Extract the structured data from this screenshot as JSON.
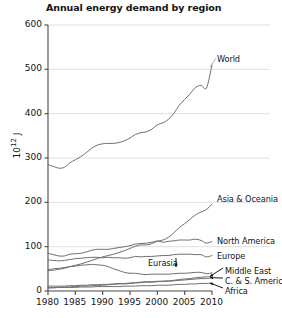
{
  "chart_data": {
    "type": "line",
    "title": "Annual energy demand by region",
    "xlabel": "",
    "ylabel": "10^12 J",
    "ylabel_base": "10",
    "ylabel_exp": "12",
    "ylabel_unit": "J",
    "xlim": [
      1980,
      2010
    ],
    "ylim": [
      0,
      600
    ],
    "yticks": [
      0,
      100,
      200,
      300,
      400,
      500,
      600
    ],
    "xticks": [
      1980,
      1985,
      1990,
      1995,
      2000,
      2005,
      2010
    ],
    "grid": "horizontal",
    "legend_position": "inline-right",
    "line_color": "#6e6e6e",
    "grid_color": "#d8d8d8",
    "axis_color": "#4a4a4a",
    "x": [
      1980,
      1981,
      1982,
      1983,
      1984,
      1985,
      1986,
      1987,
      1988,
      1989,
      1990,
      1991,
      1992,
      1993,
      1994,
      1995,
      1996,
      1997,
      1998,
      1999,
      2000,
      2001,
      2002,
      2003,
      2004,
      2005,
      2006,
      2007,
      2008,
      2009,
      2010
    ],
    "series": [
      {
        "name": "World",
        "label": "World",
        "values": [
          285,
          281,
          277,
          279,
          289,
          296,
          303,
          312,
          322,
          329,
          332,
          333,
          333,
          335,
          339,
          345,
          353,
          357,
          359,
          365,
          375,
          379,
          387,
          400,
          419,
          432,
          445,
          459,
          464,
          458,
          510
        ]
      },
      {
        "name": "Asia & Oceania",
        "label": "Asia & Oceania",
        "values": [
          46,
          47,
          49,
          51,
          55,
          58,
          61,
          65,
          69,
          73,
          77,
          80,
          83,
          87,
          91,
          96,
          101,
          104,
          104,
          107,
          112,
          115,
          121,
          131,
          143,
          152,
          162,
          172,
          178,
          184,
          196
        ]
      },
      {
        "name": "North America",
        "label": "North America",
        "values": [
          85,
          82,
          79,
          79,
          83,
          84,
          85,
          88,
          92,
          94,
          94,
          94,
          96,
          98,
          100,
          102,
          106,
          107,
          108,
          110,
          113,
          110,
          112,
          113,
          115,
          115,
          115,
          117,
          114,
          108,
          112
        ]
      },
      {
        "name": "Europe",
        "label": "Europe",
        "values": [
          70,
          69,
          68,
          69,
          71,
          73,
          74,
          75,
          76,
          76,
          75,
          76,
          75,
          75,
          74,
          75,
          78,
          77,
          78,
          78,
          79,
          80,
          80,
          82,
          83,
          83,
          83,
          82,
          82,
          77,
          80
        ]
      },
      {
        "name": "Eurasia",
        "label": "Eurasia",
        "values": [
          48,
          50,
          51,
          53,
          55,
          56,
          58,
          59,
          60,
          59,
          58,
          55,
          50,
          46,
          42,
          40,
          40,
          38,
          37,
          38,
          38,
          38,
          38,
          39,
          40,
          40,
          41,
          42,
          42,
          39,
          41
        ]
      },
      {
        "name": "Middle East",
        "label": "Middle East",
        "values": [
          7,
          8,
          8,
          9,
          9,
          10,
          11,
          11,
          12,
          13,
          13,
          14,
          15,
          16,
          16,
          17,
          18,
          19,
          20,
          20,
          21,
          22,
          23,
          24,
          26,
          27,
          28,
          30,
          31,
          32,
          33
        ]
      },
      {
        "name": "C. & S. America",
        "label": "C. & S. America",
        "values": [
          11,
          11,
          11,
          11,
          12,
          12,
          13,
          13,
          14,
          14,
          15,
          15,
          16,
          17,
          17,
          18,
          19,
          20,
          21,
          21,
          22,
          22,
          22,
          23,
          24,
          25,
          26,
          27,
          28,
          28,
          30
        ]
      },
      {
        "name": "Africa",
        "label": "Africa",
        "values": [
          7,
          7,
          8,
          8,
          8,
          8,
          9,
          9,
          9,
          10,
          10,
          10,
          10,
          10,
          11,
          11,
          11,
          12,
          12,
          12,
          13,
          13,
          13,
          14,
          15,
          15,
          16,
          16,
          17,
          17,
          18
        ]
      }
    ],
    "annotations": [
      {
        "text": "World",
        "for": "World"
      },
      {
        "text": "Asia & Oceania",
        "for": "Asia & Oceania"
      },
      {
        "text": "North America",
        "for": "North America"
      },
      {
        "text": "Europe",
        "for": "Europe"
      },
      {
        "text": "Eurasia",
        "for": "Eurasia",
        "arrow": "down"
      },
      {
        "text": "Middle East",
        "for": "Middle East",
        "arrow": "left"
      },
      {
        "text": "C. & S. America",
        "for": "C. & S. America",
        "arrow": "left"
      },
      {
        "text": "Africa",
        "for": "Africa",
        "arrow": "left"
      }
    ]
  }
}
